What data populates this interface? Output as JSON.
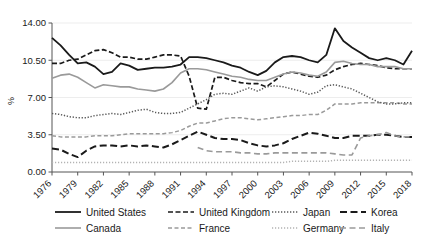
{
  "chart_data": {
    "type": "line",
    "title": "",
    "xlabel": "",
    "ylabel": "%",
    "ylim": [
      0,
      14
    ],
    "yticks": [
      "0.00",
      "3.50",
      "7.00",
      "10.50",
      "14.00"
    ],
    "ytick_values": [
      0,
      3.5,
      7,
      10.5,
      14
    ],
    "xlim": [
      1976,
      2018
    ],
    "xticks": [
      "1976",
      "1979",
      "1982",
      "1985",
      "1988",
      "1991",
      "1994",
      "1997",
      "2000",
      "2003",
      "2006",
      "2009",
      "2012",
      "2015",
      "2018"
    ],
    "xtick_values": [
      1976,
      1979,
      1982,
      1985,
      1988,
      1991,
      1994,
      1997,
      2000,
      2003,
      2006,
      2009,
      2012,
      2015,
      2018
    ],
    "grid": true,
    "legend_position": "bottom",
    "x": [
      1976,
      1977,
      1978,
      1979,
      1980,
      1981,
      1982,
      1983,
      1984,
      1985,
      1986,
      1987,
      1988,
      1989,
      1990,
      1991,
      1992,
      1993,
      1994,
      1995,
      1996,
      1997,
      1998,
      1999,
      2000,
      2001,
      2002,
      2003,
      2004,
      2005,
      2006,
      2007,
      2008,
      2009,
      2010,
      2011,
      2012,
      2013,
      2014,
      2015,
      2016,
      2017,
      2018
    ],
    "series": [
      {
        "name": "United States",
        "style": "solid",
        "color": "#1a1a1a",
        "width": 1.8,
        "values": [
          12.6,
          11.9,
          11.0,
          10.2,
          10.3,
          9.9,
          9.2,
          9.4,
          10.2,
          10.0,
          9.6,
          9.7,
          9.8,
          9.8,
          9.9,
          10.1,
          10.8,
          10.8,
          10.7,
          10.5,
          10.3,
          10.0,
          9.8,
          9.4,
          9.1,
          9.5,
          10.3,
          10.8,
          10.9,
          10.8,
          10.5,
          10.3,
          11.0,
          13.5,
          12.3,
          11.7,
          11.2,
          10.7,
          10.5,
          10.7,
          10.5,
          10.1,
          11.4
        ]
      },
      {
        "name": "United Kingdom",
        "style": "dashed",
        "color": "#1a1a1a",
        "width": 1.7,
        "values": [
          10.2,
          10.2,
          10.5,
          10.6,
          11.0,
          11.4,
          11.5,
          11.2,
          10.8,
          10.8,
          10.6,
          10.6,
          10.8,
          11.0,
          11.0,
          10.9,
          9.0,
          6.0,
          5.9,
          8.9,
          8.9,
          8.6,
          8.4,
          8.3,
          8.3,
          8.0,
          8.6,
          9.2,
          9.4,
          9.2,
          9.0,
          8.9,
          9.1,
          9.6,
          9.9,
          10.1,
          10.2,
          10.1,
          10.0,
          9.8,
          9.7,
          9.7,
          9.7
        ]
      },
      {
        "name": "Canada",
        "style": "solid",
        "color": "#9a9a9a",
        "width": 1.6,
        "values": [
          8.8,
          9.1,
          9.2,
          8.9,
          8.4,
          7.9,
          8.2,
          8.1,
          8.0,
          8.0,
          7.8,
          7.7,
          7.6,
          7.8,
          8.4,
          9.3,
          9.7,
          9.7,
          9.6,
          9.4,
          9.2,
          9.0,
          8.9,
          8.7,
          8.6,
          8.6,
          8.9,
          9.2,
          9.4,
          9.3,
          9.1,
          9.0,
          9.4,
          10.3,
          10.4,
          10.2,
          10.1,
          10.1,
          9.9,
          9.9,
          9.9,
          9.7,
          9.7
        ]
      },
      {
        "name": "France",
        "style": "dashed-light",
        "color": "#9a9a9a",
        "width": 1.5,
        "values": [
          3.4,
          3.3,
          3.3,
          3.3,
          3.3,
          3.4,
          3.4,
          3.4,
          3.5,
          3.6,
          3.6,
          3.6,
          3.6,
          3.6,
          3.7,
          3.9,
          4.3,
          4.6,
          4.6,
          4.8,
          5.0,
          5.1,
          5.1,
          5.0,
          4.9,
          5.0,
          5.1,
          5.2,
          5.3,
          5.3,
          5.4,
          5.4,
          5.8,
          6.4,
          6.4,
          6.4,
          6.5,
          6.5,
          6.5,
          6.5,
          6.5,
          6.4,
          6.4
        ]
      },
      {
        "name": "Japan",
        "style": "dotted",
        "color": "#5a5a5a",
        "width": 1.5,
        "values": [
          5.5,
          5.4,
          5.2,
          5.1,
          5.1,
          5.3,
          5.4,
          5.5,
          5.4,
          5.6,
          5.8,
          5.9,
          5.6,
          5.5,
          5.5,
          5.6,
          6.0,
          6.4,
          6.8,
          7.3,
          7.4,
          7.3,
          7.6,
          7.9,
          7.6,
          8.0,
          8.1,
          8.0,
          7.8,
          7.6,
          7.3,
          7.5,
          8.1,
          8.2,
          8.0,
          7.8,
          7.4,
          7.0,
          6.6,
          6.4,
          6.4,
          6.5,
          6.5
        ]
      },
      {
        "name": "Germany",
        "style": "dotted-light",
        "color": "#b3b3b3",
        "width": 1.5,
        "values": [
          0.9,
          0.9,
          0.9,
          0.9,
          0.9,
          0.9,
          0.9,
          0.9,
          0.9,
          0.9,
          0.9,
          0.9,
          0.9,
          0.9,
          0.9,
          0.9,
          0.9,
          0.9,
          0.9,
          0.9,
          0.9,
          0.9,
          0.9,
          0.9,
          0.9,
          0.9,
          0.9,
          0.9,
          1.0,
          1.0,
          1.0,
          1.0,
          1.0,
          1.1,
          1.1,
          1.1,
          1.1,
          1.1,
          1.1,
          1.1,
          1.1,
          1.1,
          1.1
        ]
      },
      {
        "name": "Korea",
        "style": "long-dash",
        "color": "#1a1a1a",
        "width": 2.0,
        "values": [
          2.2,
          2.1,
          1.7,
          1.4,
          2.0,
          2.4,
          2.5,
          2.5,
          2.4,
          2.5,
          2.4,
          2.5,
          2.4,
          2.3,
          2.6,
          3.0,
          3.4,
          3.8,
          3.5,
          3.2,
          3.1,
          3.1,
          3.0,
          2.7,
          2.5,
          2.4,
          2.5,
          2.7,
          3.1,
          3.4,
          3.7,
          3.6,
          3.4,
          3.2,
          3.2,
          3.4,
          3.4,
          3.4,
          3.5,
          3.5,
          3.4,
          3.3,
          3.3
        ]
      },
      {
        "name": "Italy",
        "style": "long-dash-light",
        "color": "#9a9a9a",
        "width": 1.6,
        "values": [
          null,
          null,
          null,
          null,
          null,
          null,
          null,
          null,
          null,
          null,
          null,
          null,
          null,
          null,
          null,
          null,
          null,
          2.3,
          2.0,
          1.9,
          1.9,
          1.9,
          1.8,
          1.8,
          1.7,
          1.7,
          1.8,
          1.8,
          1.8,
          1.8,
          1.8,
          1.8,
          1.8,
          1.7,
          1.6,
          1.6,
          3.2,
          3.4,
          3.5,
          3.7,
          3.4,
          3.3,
          3.3
        ]
      }
    ],
    "legend": [
      {
        "label": "United States",
        "style": "solid",
        "color": "#1a1a1a",
        "width": 1.8
      },
      {
        "label": "United Kingdom",
        "style": "dashed",
        "color": "#1a1a1a",
        "width": 1.7
      },
      {
        "label": "Japan",
        "style": "dotted",
        "color": "#5a5a5a",
        "width": 1.5
      },
      {
        "label": "Korea",
        "style": "long-dash",
        "color": "#1a1a1a",
        "width": 2.0
      },
      {
        "label": "Canada",
        "style": "solid",
        "color": "#9a9a9a",
        "width": 1.6
      },
      {
        "label": "France",
        "style": "dashed-light",
        "color": "#9a9a9a",
        "width": 1.5
      },
      {
        "label": "Germany",
        "style": "dotted-light",
        "color": "#b3b3b3",
        "width": 1.5
      },
      {
        "label": "Italy",
        "style": "long-dash-light",
        "color": "#9a9a9a",
        "width": 1.6
      }
    ]
  }
}
